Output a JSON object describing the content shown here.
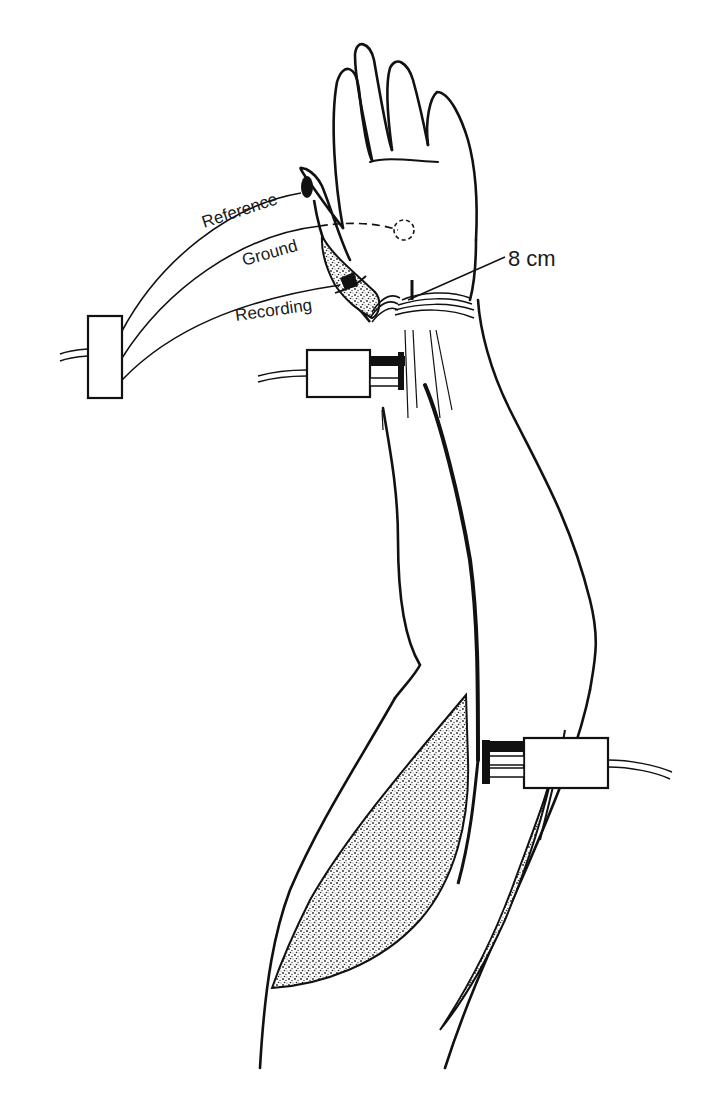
{
  "figure": {
    "labels": {
      "reference": "Reference",
      "ground": "Ground",
      "recording": "Recording",
      "distance": "8 cm"
    },
    "components": [
      {
        "name": "recording-amplifier-box",
        "description": "Box connected to reference, ground and recording leads"
      },
      {
        "name": "wrist-stimulator",
        "description": "Stimulator applied at wrist"
      },
      {
        "name": "elbow-stimulator",
        "description": "Stimulator applied at elbow"
      },
      {
        "name": "thenar-muscle",
        "description": "Stippled thenar eminence with recording electrode"
      },
      {
        "name": "forearm-muscle",
        "description": "Stippled forearm muscle region"
      },
      {
        "name": "ground-electrode-site",
        "description": "Dashed circle on palm"
      }
    ],
    "colors": {
      "ink": "#111111",
      "background": "#ffffff",
      "stipple": "#3a3a3a"
    }
  }
}
